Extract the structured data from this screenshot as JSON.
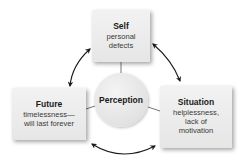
{
  "diagram": {
    "type": "cycle",
    "center": {
      "label": "Perception"
    },
    "nodes": [
      {
        "id": "self",
        "title": "Self",
        "description": "personal defects"
      },
      {
        "id": "situation",
        "title": "Situation",
        "description": "helplessness, lack of motivation"
      },
      {
        "id": "future",
        "title": "Future",
        "description": "timelessness—will last forever"
      }
    ],
    "edges": [
      {
        "from": "self",
        "to": "situation",
        "style": "double-arrow-curved"
      },
      {
        "from": "situation",
        "to": "future",
        "style": "double-arrow-curved"
      },
      {
        "from": "future",
        "to": "self",
        "style": "double-arrow-curved"
      },
      {
        "from": "center",
        "to": "self",
        "style": "line"
      },
      {
        "from": "center",
        "to": "situation",
        "style": "line"
      },
      {
        "from": "center",
        "to": "future",
        "style": "line"
      }
    ],
    "colors": {
      "box_fill": "#ececec",
      "text": "#1a1a1a",
      "arrow": "#1a1a1a",
      "connector": "#555555"
    }
  },
  "text": {
    "self_title": "Self",
    "self_line1": "personal",
    "self_line2": "defects",
    "situation_title": "Situation",
    "situation_line1": "helplessness,",
    "situation_line2": "lack of",
    "situation_line3": "motivation",
    "future_title": "Future",
    "future_line1": "timelessness—",
    "future_line2": "will last forever",
    "center_label": "Perception"
  }
}
